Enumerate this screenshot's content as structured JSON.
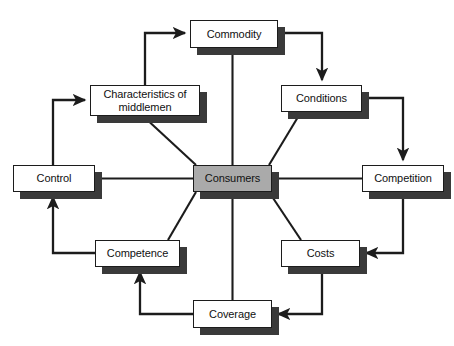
{
  "diagram": {
    "type": "hub-and-spoke cycle diagram",
    "center": {
      "id": "consumers",
      "label": "Consumers",
      "fill": "#aaaaaa",
      "x": 193,
      "y": 165,
      "w": 79,
      "h": 27
    },
    "nodes": [
      {
        "id": "commodity",
        "label": "Commodity",
        "fill": "#ffffff",
        "x": 190,
        "y": 20,
        "w": 88,
        "h": 28
      },
      {
        "id": "conditions",
        "label": "Conditions",
        "fill": "#ffffff",
        "x": 281,
        "y": 85,
        "w": 81,
        "h": 27
      },
      {
        "id": "competition",
        "label": "Competition",
        "fill": "#ffffff",
        "x": 362,
        "y": 165,
        "w": 82,
        "h": 27
      },
      {
        "id": "costs",
        "label": "Costs",
        "fill": "#ffffff",
        "x": 281,
        "y": 240,
        "w": 79,
        "h": 27
      },
      {
        "id": "coverage",
        "label": "Coverage",
        "fill": "#ffffff",
        "x": 193,
        "y": 300,
        "w": 79,
        "h": 28
      },
      {
        "id": "competence",
        "label": "Competence",
        "fill": "#ffffff",
        "x": 95,
        "y": 240,
        "w": 85,
        "h": 27
      },
      {
        "id": "control",
        "label": "Control",
        "fill": "#ffffff",
        "x": 13,
        "y": 165,
        "w": 82,
        "h": 27
      },
      {
        "id": "characteristics",
        "label": "Characteristics of\nmiddlemen",
        "fill": "#ffffff",
        "x": 90,
        "y": 85,
        "w": 110,
        "h": 31
      }
    ],
    "spokes": [
      {
        "from": "consumers",
        "to": "commodity",
        "style": "line"
      },
      {
        "from": "consumers",
        "to": "conditions",
        "style": "line"
      },
      {
        "from": "consumers",
        "to": "competition",
        "style": "line"
      },
      {
        "from": "consumers",
        "to": "costs",
        "style": "line"
      },
      {
        "from": "consumers",
        "to": "coverage",
        "style": "line"
      },
      {
        "from": "consumers",
        "to": "competence",
        "style": "line"
      },
      {
        "from": "consumers",
        "to": "control",
        "style": "line"
      },
      {
        "from": "consumers",
        "to": "characteristics",
        "style": "line"
      }
    ],
    "cycle_arrows": [
      {
        "from": "characteristics",
        "to": "commodity",
        "style": "elbow-arrow"
      },
      {
        "from": "commodity",
        "to": "conditions",
        "style": "elbow-arrow"
      },
      {
        "from": "conditions",
        "to": "competition",
        "style": "elbow-arrow"
      },
      {
        "from": "competition",
        "to": "costs",
        "style": "elbow-arrow"
      },
      {
        "from": "costs",
        "to": "coverage",
        "style": "elbow-arrow"
      },
      {
        "from": "coverage",
        "to": "competence",
        "style": "elbow-arrow"
      },
      {
        "from": "competence",
        "to": "control",
        "style": "elbow-arrow"
      },
      {
        "from": "control",
        "to": "characteristics",
        "style": "elbow-arrow"
      }
    ],
    "colors": {
      "background": "#ffffff",
      "box_fill": "#ffffff",
      "center_fill": "#aaaaaa",
      "stroke": "#1c1c1c",
      "shadow": "#3a3a3a",
      "text": "#111111"
    }
  }
}
